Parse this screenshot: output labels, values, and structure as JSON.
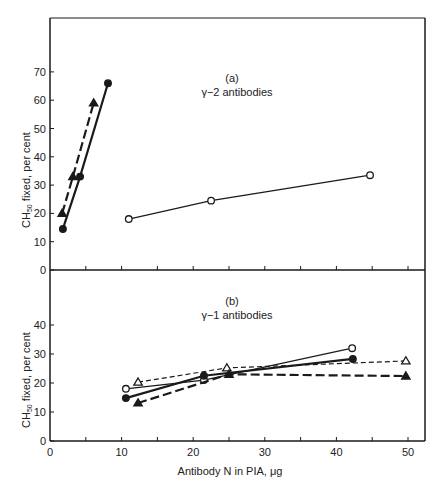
{
  "chart_data": [
    {
      "type": "line",
      "panel": "(a)",
      "title": "γ−2 antibodies",
      "xlabel": "Antibody N in PIA, μg",
      "ylabel": "CH50 fixed, per cent",
      "xlim": [
        0,
        52
      ],
      "ylim": [
        0,
        80
      ],
      "yticks": [
        0,
        10,
        20,
        30,
        40,
        50,
        60,
        70
      ],
      "xticks": [
        0,
        5,
        10,
        15,
        20,
        25,
        30,
        35,
        40,
        45,
        50
      ],
      "grid": false,
      "series": [
        {
          "name": "filled circles",
          "marker": "filled-circle",
          "line": "solid-thick",
          "x": [
            1.8,
            4.2,
            8.1
          ],
          "y": [
            14.5,
            33,
            66
          ]
        },
        {
          "name": "filled triangles",
          "marker": "filled-triangle",
          "line": "dashed-thick",
          "x": [
            1.7,
            3.2,
            6.1
          ],
          "y": [
            20,
            33,
            59
          ]
        },
        {
          "name": "open circles",
          "marker": "open-circle",
          "line": "solid-thin",
          "x": [
            11.0,
            22.5,
            44.7
          ],
          "y": [
            18,
            24.5,
            33.5
          ]
        }
      ]
    },
    {
      "type": "line",
      "panel": "(b)",
      "title": "γ−1 antibodies",
      "xlabel": "Antibody N in PIA, μg",
      "ylabel": "CH50 fixed, per cent",
      "xlim": [
        0,
        52
      ],
      "ylim": [
        0,
        50
      ],
      "yticks": [
        0,
        10,
        20,
        30,
        40
      ],
      "xticks": [
        0,
        5,
        10,
        15,
        20,
        25,
        30,
        35,
        40,
        45,
        50
      ],
      "xticklabels": [
        "0",
        "10",
        "20",
        "30",
        "40",
        "50"
      ],
      "grid": false,
      "series": [
        {
          "name": "open circles",
          "marker": "open-circle",
          "line": "solid-thin",
          "x": [
            10.6,
            21.5,
            42.2
          ],
          "y": [
            18,
            21,
            32
          ]
        },
        {
          "name": "filled circles",
          "marker": "filled-circle",
          "line": "solid-thick",
          "x": [
            10.6,
            21.5,
            42.3
          ],
          "y": [
            14.8,
            22.5,
            28.3
          ]
        },
        {
          "name": "open triangles",
          "marker": "open-triangle",
          "line": "dashed-thin",
          "x": [
            12.3,
            24.7,
            49.7
          ],
          "y": [
            20.3,
            25.2,
            27.6
          ]
        },
        {
          "name": "filled triangles",
          "marker": "filled-triangle",
          "line": "dashed-thick",
          "x": [
            12.3,
            25,
            49.7
          ],
          "y": [
            13.1,
            23,
            22.4
          ]
        }
      ]
    }
  ],
  "labels": {
    "panel_a_letter": "(a)",
    "panel_a_title": "γ−2 antibodies",
    "panel_b_letter": "(b)",
    "panel_b_title": "γ−1 antibodies",
    "ylabel_prefix": "CH",
    "ylabel_sub": "50",
    "ylabel_suffix": " fixed, per cent",
    "xlabel": "Antibody N in PIA, μg"
  },
  "colors": {
    "ink": "#1a1a1a",
    "background": "#ffffff"
  }
}
